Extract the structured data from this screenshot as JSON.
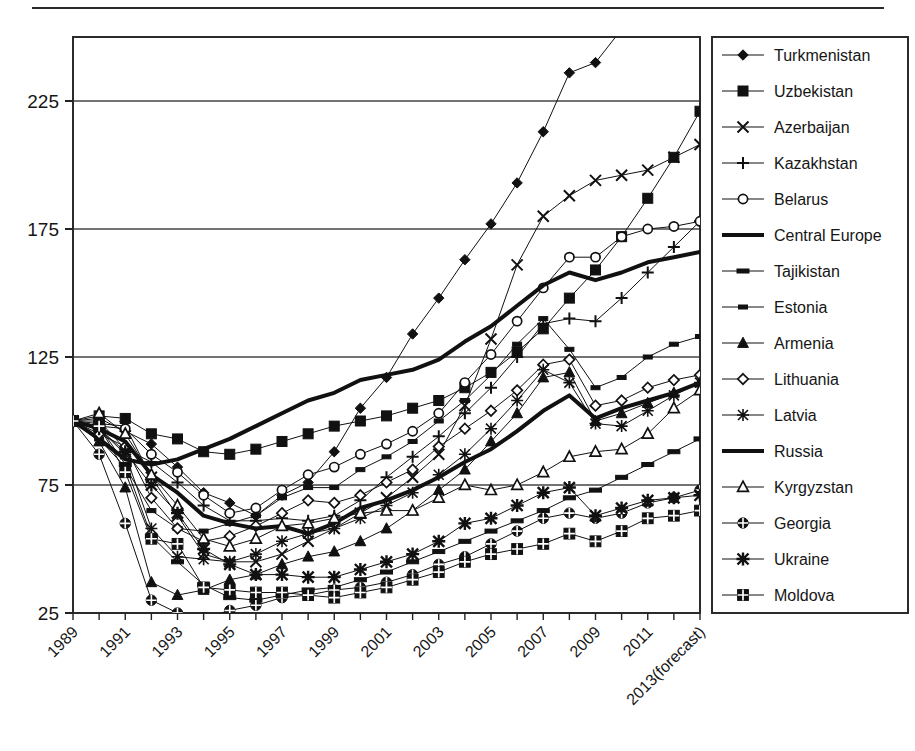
{
  "figure": {
    "has_top_rule": true,
    "frame_color": "#2b2b2b",
    "background": "#ffffff"
  },
  "chart_data": {
    "type": "line",
    "title": "",
    "subtitle": "",
    "xlabel": "",
    "ylabel": "",
    "grid": true,
    "grid_axis": "y",
    "legend_position": "right",
    "xlim": [
      1989,
      2013
    ],
    "ylim": [
      25,
      250
    ],
    "yticks": [
      25,
      75,
      125,
      175,
      225
    ],
    "ytick_labels": [
      "25",
      "75",
      "125",
      "175",
      "225"
    ],
    "x": [
      1989,
      1990,
      1991,
      1992,
      1993,
      1994,
      1995,
      1996,
      1997,
      1998,
      1999,
      2000,
      2001,
      2002,
      2003,
      2004,
      2005,
      2006,
      2007,
      2008,
      2009,
      2010,
      2011,
      2012,
      2013
    ],
    "xticks": [
      1989,
      1991,
      1993,
      1995,
      1997,
      1999,
      2001,
      2003,
      2005,
      2007,
      2009,
      2011,
      2013
    ],
    "xtick_labels": [
      "1989",
      "1991",
      "1993",
      "1995",
      "1997",
      "1999",
      "2001",
      "2003",
      "2005",
      "2007",
      "2009",
      "2011",
      "2013(forecast)"
    ],
    "xtick_rotation_deg": 45,
    "series": [
      {
        "name": "Turkmenistan",
        "marker": "diamond",
        "linewidth": 1,
        "values": [
          100,
          101,
          96,
          91,
          82,
          72,
          68,
          63,
          71,
          76,
          88,
          105,
          117,
          134,
          148,
          163,
          177,
          193,
          213,
          236,
          240,
          253,
          271,
          286,
          300
        ]
      },
      {
        "name": "Uzbekistan",
        "marker": "square-filled",
        "linewidth": 1,
        "values": [
          100,
          102,
          101,
          95,
          93,
          88,
          87,
          89,
          92,
          95,
          98,
          100,
          102,
          105,
          108,
          113,
          119,
          127,
          136,
          148,
          159,
          172,
          187,
          203,
          221
        ]
      },
      {
        "name": "Azerbaijan",
        "marker": "x",
        "linewidth": 1,
        "values": [
          100,
          99,
          98,
          78,
          63,
          48,
          45,
          45,
          48,
          53,
          58,
          64,
          70,
          78,
          87,
          106,
          132,
          161,
          180,
          188,
          194,
          196,
          198,
          203,
          208
        ]
      },
      {
        "name": "Kazakhstan",
        "marker": "plus",
        "linewidth": 1,
        "values": [
          100,
          100,
          89,
          84,
          76,
          67,
          61,
          61,
          62,
          61,
          63,
          69,
          78,
          86,
          94,
          103,
          113,
          125,
          138,
          140,
          139,
          148,
          158,
          168,
          178
        ]
      },
      {
        "name": "Belarus",
        "marker": "circle-open",
        "linewidth": 1,
        "values": [
          100,
          98,
          97,
          87,
          80,
          71,
          64,
          66,
          73,
          79,
          82,
          87,
          91,
          96,
          103,
          115,
          126,
          139,
          152,
          164,
          164,
          172,
          175,
          176,
          178
        ]
      },
      {
        "name": "Central Europe",
        "marker": "none",
        "linewidth": 4,
        "values": [
          100,
          93,
          85,
          83,
          85,
          89,
          93,
          98,
          103,
          108,
          111,
          116,
          118,
          120,
          124,
          131,
          137,
          145,
          153,
          158,
          155,
          158,
          162,
          164,
          166
        ]
      },
      {
        "name": "Tajikistan",
        "marker": "dash",
        "linewidth": 1,
        "values": [
          100,
          98,
          83,
          55,
          45,
          36,
          31,
          30,
          32,
          34,
          35,
          38,
          41,
          45,
          49,
          53,
          57,
          61,
          65,
          70,
          73,
          78,
          83,
          88,
          93
        ]
      },
      {
        "name": "Estonia",
        "marker": "small-dash",
        "linewidth": 1,
        "values": [
          100,
          93,
          82,
          65,
          58,
          57,
          60,
          63,
          70,
          74,
          74,
          81,
          86,
          92,
          100,
          108,
          118,
          130,
          140,
          128,
          113,
          117,
          125,
          130,
          133
        ]
      },
      {
        "name": "Armenia",
        "marker": "triangle-filled",
        "linewidth": 1,
        "values": [
          100,
          92,
          74,
          37,
          32,
          34,
          38,
          40,
          44,
          47,
          49,
          53,
          58,
          65,
          73,
          81,
          92,
          103,
          117,
          119,
          100,
          103,
          107,
          111,
          115
        ]
      },
      {
        "name": "Lithuania",
        "marker": "diamond-open",
        "linewidth": 1,
        "values": [
          100,
          95,
          90,
          70,
          58,
          53,
          55,
          59,
          64,
          69,
          68,
          71,
          76,
          81,
          90,
          97,
          104,
          112,
          122,
          124,
          106,
          108,
          113,
          116,
          118
        ]
      },
      {
        "name": "Latvia",
        "marker": "asterisk",
        "linewidth": 1,
        "values": [
          100,
          97,
          87,
          58,
          47,
          46,
          45,
          48,
          53,
          56,
          58,
          62,
          67,
          72,
          79,
          87,
          97,
          108,
          120,
          115,
          99,
          98,
          104,
          110,
          115
        ]
      },
      {
        "name": "Russia",
        "marker": "none",
        "linewidth": 4,
        "values": [
          100,
          97,
          92,
          79,
          72,
          63,
          60,
          58,
          59,
          56,
          60,
          66,
          69,
          73,
          78,
          84,
          89,
          96,
          104,
          110,
          101,
          105,
          108,
          111,
          115
        ]
      },
      {
        "name": "Kyrgyzstan",
        "marker": "triangle-open",
        "linewidth": 1,
        "values": [
          100,
          103,
          95,
          79,
          67,
          54,
          51,
          54,
          59,
          60,
          62,
          64,
          65,
          65,
          70,
          75,
          73,
          75,
          80,
          86,
          88,
          89,
          95,
          105,
          112
        ]
      },
      {
        "name": "Georgia",
        "marker": "circle-cross",
        "linewidth": 1,
        "values": [
          100,
          87,
          60,
          30,
          25,
          23,
          26,
          28,
          31,
          32,
          34,
          35,
          37,
          40,
          44,
          47,
          52,
          57,
          62,
          64,
          62,
          64,
          68,
          70,
          73
        ]
      },
      {
        "name": "Ukraine",
        "marker": "asterisk-heavy",
        "linewidth": 1,
        "values": [
          100,
          97,
          88,
          75,
          64,
          50,
          44,
          40,
          40,
          39,
          39,
          42,
          45,
          48,
          53,
          60,
          62,
          67,
          72,
          74,
          63,
          66,
          69,
          70,
          71
        ]
      },
      {
        "name": "Moldova",
        "marker": "square-cross",
        "linewidth": 1,
        "values": [
          100,
          98,
          80,
          54,
          52,
          35,
          34,
          33,
          33,
          32,
          31,
          33,
          35,
          38,
          41,
          45,
          48,
          50,
          52,
          56,
          53,
          57,
          62,
          63,
          65
        ]
      }
    ]
  },
  "legend": {
    "items": [
      {
        "label": "Turkmenistan"
      },
      {
        "label": "Uzbekistan"
      },
      {
        "label": "Azerbaijan"
      },
      {
        "label": "Kazakhstan"
      },
      {
        "label": "Belarus"
      },
      {
        "label": "Central Europe"
      },
      {
        "label": "Tajikistan"
      },
      {
        "label": "Estonia"
      },
      {
        "label": "Armenia"
      },
      {
        "label": "Lithuania"
      },
      {
        "label": "Latvia"
      },
      {
        "label": "Russia"
      },
      {
        "label": "Kyrgyzstan"
      },
      {
        "label": "Georgia"
      },
      {
        "label": "Ukraine"
      },
      {
        "label": "Moldova"
      }
    ]
  }
}
